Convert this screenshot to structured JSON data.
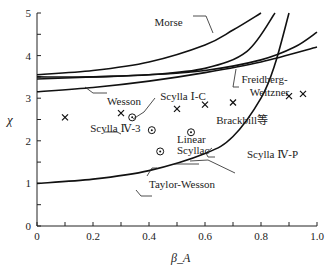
{
  "chart_data": {
    "type": "line",
    "title": "",
    "xlabel": "β_A",
    "ylabel": "χ",
    "xlim": [
      0,
      1.0
    ],
    "ylim": [
      0,
      5
    ],
    "grid": false,
    "xticks": [
      0,
      0.2,
      0.4,
      0.6,
      0.8,
      1.0
    ],
    "xtick_labels": [
      "0",
      "0.2",
      "0.4",
      "0.6",
      "0.8",
      "1.0"
    ],
    "yticks": [
      0,
      1,
      2,
      3,
      4,
      5
    ],
    "ytick_labels": [
      "0",
      "1",
      "2",
      "3",
      "4",
      "5"
    ],
    "series": [
      {
        "name": "Morse",
        "x": [
          0,
          0.2,
          0.4,
          0.6,
          0.7,
          0.8
        ],
        "y": [
          3.55,
          3.65,
          3.85,
          4.25,
          4.6,
          5.0
        ]
      },
      {
        "name": "Morse (inner)",
        "x": [
          0,
          0.2,
          0.4,
          0.6,
          0.75,
          0.85
        ],
        "y": [
          3.45,
          3.5,
          3.55,
          3.7,
          4.1,
          5.0
        ]
      },
      {
        "name": "Freidberg-Weitzner",
        "x": [
          0,
          0.2,
          0.4,
          0.6,
          0.8,
          0.92,
          1.0
        ],
        "y": [
          3.5,
          3.5,
          3.55,
          3.65,
          3.9,
          4.2,
          4.55
        ]
      },
      {
        "name": "Wesson",
        "x": [
          0,
          0.2,
          0.4,
          0.6,
          0.8,
          1.0
        ],
        "y": [
          3.15,
          3.25,
          3.4,
          3.6,
          3.85,
          4.2
        ]
      },
      {
        "name": "Taylor-Wesson",
        "x": [
          0,
          0.2,
          0.4,
          0.6,
          0.7,
          0.8,
          0.85,
          0.9
        ],
        "y": [
          1.0,
          1.1,
          1.3,
          1.7,
          2.1,
          3.0,
          3.8,
          5.0
        ]
      }
    ],
    "points_x": {
      "marker": "x",
      "x": [
        0.1,
        0.3,
        0.5,
        0.6,
        0.7,
        0.9,
        0.95
      ],
      "y": [
        2.55,
        2.65,
        2.75,
        2.85,
        2.9,
        3.05,
        3.1
      ]
    },
    "points_circle": {
      "marker": "circle-dot",
      "x": [
        0.34,
        0.41,
        0.44,
        0.55
      ],
      "y": [
        2.55,
        2.25,
        1.75,
        2.2
      ]
    },
    "annotations": [
      {
        "text": "Morse",
        "x": 0.42,
        "y": 4.7
      },
      {
        "text": "Freidberg-",
        "x": 0.73,
        "y": 3.35
      },
      {
        "text": "Weitzner",
        "x": 0.76,
        "y": 3.05
      },
      {
        "text": "Wesson",
        "x": 0.25,
        "y": 2.85
      },
      {
        "text": "Scylla Ⅰ-C",
        "x": 0.44,
        "y": 2.95
      },
      {
        "text": "Brackbill等",
        "x": 0.64,
        "y": 2.4
      },
      {
        "text": "Scylla Ⅳ-3",
        "x": 0.19,
        "y": 2.2
      },
      {
        "text": "Linear",
        "x": 0.5,
        "y": 1.95
      },
      {
        "text": "Scyllac",
        "x": 0.5,
        "y": 1.7
      },
      {
        "text": "Scylla Ⅳ-P",
        "x": 0.75,
        "y": 1.6
      },
      {
        "text": "Taylor-Wesson",
        "x": 0.4,
        "y": 0.9
      }
    ]
  }
}
